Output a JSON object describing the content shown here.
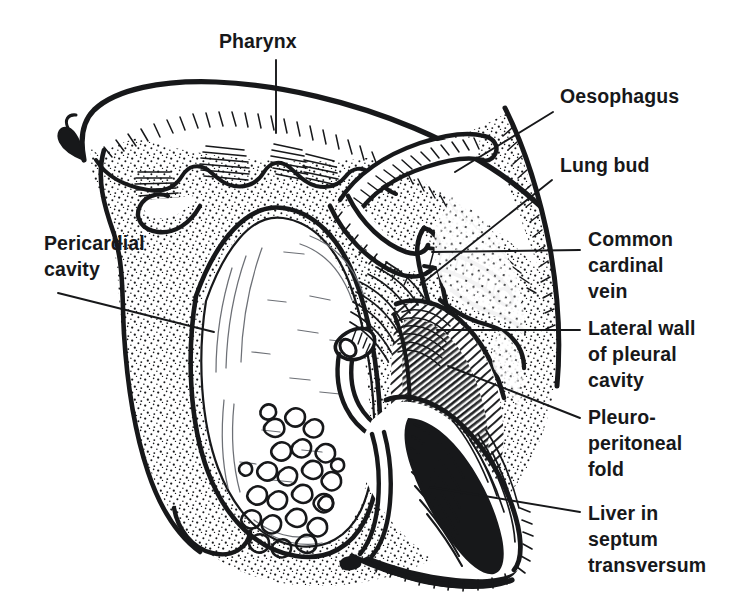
{
  "figure": {
    "kind": "anatomical-line-drawing",
    "style": "black-and-white pen-and-ink stipple/hatch illustration",
    "background_color": "#FFFFFF",
    "ink_color": "#17181A"
  },
  "labels": [
    {
      "id": "pharynx",
      "lines": [
        "Pharynx"
      ],
      "anchor": "top",
      "text_x": 219,
      "text_y": 48,
      "leader": [
        [
          276,
          60
        ],
        [
          276,
          133
        ]
      ]
    },
    {
      "id": "oesophagus",
      "lines": [
        "Oesophagus"
      ],
      "anchor": "right",
      "text_x": 560,
      "text_y": 103,
      "leader": [
        [
          553,
          112
        ],
        [
          455,
          172
        ]
      ]
    },
    {
      "id": "lung-bud",
      "lines": [
        "Lung bud"
      ],
      "anchor": "right",
      "text_x": 560,
      "text_y": 172,
      "leader": [
        [
          552,
          180
        ],
        [
          420,
          285
        ]
      ]
    },
    {
      "id": "common-cardinal-vein",
      "lines": [
        "Common",
        "cardinal",
        "vein"
      ],
      "anchor": "right",
      "text_x": 588,
      "text_y": 246,
      "leader": [
        [
          580,
          250
        ],
        [
          432,
          252
        ]
      ]
    },
    {
      "id": "lateral-wall-of-pleural-cavity",
      "lines": [
        "Lateral wall",
        "of pleural",
        "cavity"
      ],
      "anchor": "right",
      "text_x": 588,
      "text_y": 335,
      "leader": [
        [
          580,
          330
        ],
        [
          437,
          330
        ]
      ]
    },
    {
      "id": "pleuroperitoneal-fold",
      "lines": [
        "Pleuro-",
        "peritoneal",
        "fold"
      ],
      "anchor": "right",
      "text_x": 588,
      "text_y": 424,
      "leader": [
        [
          580,
          418
        ],
        [
          448,
          366
        ]
      ]
    },
    {
      "id": "liver-in-septum-transversum",
      "lines": [
        "Liver in",
        "septum",
        "transversum"
      ],
      "anchor": "right",
      "text_x": 588,
      "text_y": 520,
      "leader": [
        [
          580,
          512
        ],
        [
          430,
          487
        ]
      ]
    },
    {
      "id": "pericardial-cavity",
      "lines": [
        "Pericardial",
        "cavity"
      ],
      "anchor": "left",
      "text_x": 44,
      "text_y": 250,
      "leader": [
        [
          58,
          293
        ],
        [
          214,
          332
        ]
      ]
    }
  ],
  "structures": [
    {
      "id": "pharynx-roof",
      "name": "Pharynx roof with pharyngeal pouches"
    },
    {
      "id": "pericardial-cavity-lumen",
      "name": "Pericardial cavity"
    },
    {
      "id": "pleural-cavity",
      "name": "Pleural cavity"
    },
    {
      "id": "oesophagus-tube",
      "name": "Oesophagus"
    },
    {
      "id": "lung-bud-tube",
      "name": "Lung bud"
    },
    {
      "id": "common-cardinal-vein-tube",
      "name": "Common cardinal vein"
    },
    {
      "id": "pleuroperitoneal-fold-mass",
      "name": "Pleuroperitoneal fold"
    },
    {
      "id": "liver-mass",
      "name": "Liver in septum transversum"
    },
    {
      "id": "glandular-tissue",
      "name": "Hepatic cord tissue"
    },
    {
      "id": "body-wall",
      "name": "Lateral body wall"
    }
  ]
}
